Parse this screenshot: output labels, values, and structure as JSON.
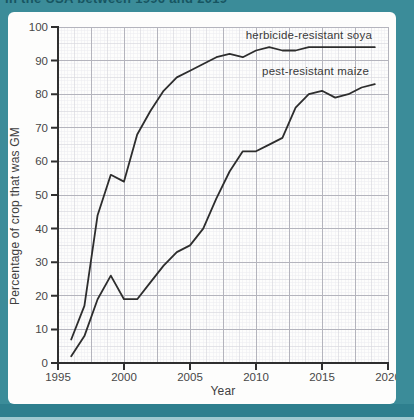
{
  "caption_fragment": "in the USA between 1996 and 2019",
  "frame": {
    "background_teal": "#3b8c99",
    "band_dark": "#2e7f8e",
    "band_light": "#9fc9d0",
    "card_white": "#fdfdfc"
  },
  "chart_data": {
    "type": "line",
    "title": "",
    "xlabel": "Year",
    "ylabel": "Percentage of crop that was GM",
    "xlim": [
      1995,
      2020
    ],
    "ylim": [
      0,
      100
    ],
    "xticks": [
      1995,
      2000,
      2005,
      2010,
      2015,
      2020
    ],
    "yticks": [
      0,
      10,
      20,
      30,
      40,
      50,
      60,
      70,
      80,
      90,
      100
    ],
    "grid": "fine graph paper; bold rule every 10 minor squares",
    "legend_position": "inline labels at top right of plot",
    "line_color": "#2d2d2d",
    "axis_color": "#2f2f2f",
    "x": [
      1996,
      1997,
      1998,
      1999,
      2000,
      2001,
      2002,
      2003,
      2004,
      2005,
      2006,
      2007,
      2008,
      2009,
      2010,
      2011,
      2012,
      2013,
      2014,
      2015,
      2016,
      2017,
      2018,
      2019
    ],
    "series": [
      {
        "name": "herbicide-resistant soya",
        "values": [
          7,
          17,
          44,
          56,
          54,
          68,
          75,
          81,
          85,
          87,
          89,
          91,
          92,
          91,
          93,
          94,
          93,
          93,
          94,
          94,
          94,
          94,
          94,
          94
        ]
      },
      {
        "name": "pest-resistant maize",
        "values": [
          2,
          8,
          19,
          26,
          19,
          19,
          24,
          29,
          33,
          35,
          40,
          49,
          57,
          63,
          63,
          65,
          67,
          76,
          80,
          81,
          79,
          80,
          82,
          83
        ]
      }
    ]
  }
}
